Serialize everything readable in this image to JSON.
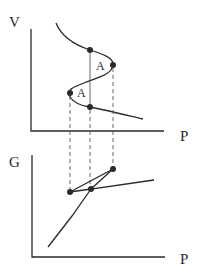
{
  "top_plot": {
    "y_label": "V",
    "x_label": "P",
    "area_labels": [
      "A",
      "A"
    ],
    "curve": "van der Waals isotherm S-curve",
    "points": [
      {
        "name": "upper-equal-pressure",
        "x": 90,
        "y": 50
      },
      {
        "name": "local-max-pressure",
        "x": 113,
        "y": 65
      },
      {
        "name": "local-min-pressure",
        "x": 70,
        "y": 93
      },
      {
        "name": "lower-equal-pressure",
        "x": 90,
        "y": 107
      }
    ]
  },
  "bottom_plot": {
    "y_label": "G",
    "x_label": "P",
    "points": [
      {
        "name": "cusp-left",
        "x": 70,
        "y": 192
      },
      {
        "name": "crossing",
        "x": 91,
        "y": 189
      },
      {
        "name": "cusp-right",
        "x": 113,
        "y": 169
      }
    ]
  },
  "colors": {
    "ink": "#2a2a2a",
    "guide": "#555555"
  }
}
